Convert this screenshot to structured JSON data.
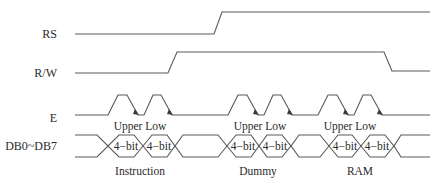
{
  "diagram": {
    "type": "timing-diagram",
    "signals": [
      {
        "name": "RS",
        "label": "RS"
      },
      {
        "name": "RW",
        "label": "R/W"
      },
      {
        "name": "E",
        "label": "E"
      },
      {
        "name": "DB",
        "label": "DB0~DB7"
      }
    ],
    "pulse_labels": [
      "Upper Low",
      "Upper Low",
      "Upper Low"
    ],
    "bus_cell_label": "4−bit",
    "phase_labels": [
      "Instruction",
      "Dummy",
      "RAM"
    ]
  }
}
